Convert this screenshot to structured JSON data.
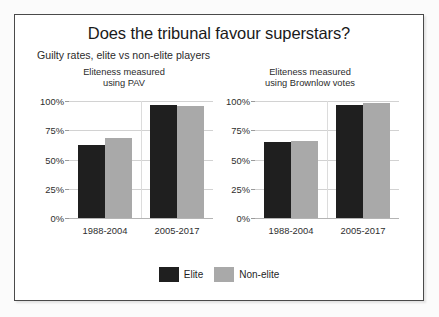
{
  "chart_data": {
    "type": "bar",
    "title": "Does the tribunal favour superstars?",
    "subtitle": "Guilty rates, elite vs non-elite players",
    "xlabel": "",
    "ylabel": "",
    "ylim": [
      0,
      100
    ],
    "grid": true,
    "legend_position": "bottom-center",
    "y_ticks": [
      "0%",
      "25%",
      "50%",
      "75%",
      "100%"
    ],
    "y_tick_values": [
      0,
      25,
      50,
      75,
      100
    ],
    "categories": [
      "1988-2004",
      "2005-2017"
    ],
    "legend": [
      "Elite",
      "Non-elite"
    ],
    "panels": [
      {
        "title_line1": "Eliteness measured",
        "title_line2": "using PAV",
        "series": [
          {
            "name": "Elite",
            "color": "#1f1f1f",
            "values": [
              62,
              97
            ]
          },
          {
            "name": "Non-elite",
            "color": "#a9a9a9",
            "values": [
              68,
              96
            ]
          }
        ]
      },
      {
        "title_line1": "Eliteness measured",
        "title_line2": "using Brownlow votes",
        "series": [
          {
            "name": "Elite",
            "color": "#1f1f1f",
            "values": [
              65,
              97
            ]
          },
          {
            "name": "Non-elite",
            "color": "#a9a9a9",
            "values": [
              66,
              98
            ]
          }
        ]
      }
    ]
  },
  "chart": {
    "title": "Does the tribunal favour superstars?",
    "subtitle": "Guilty rates, elite vs non-elite players"
  },
  "panel_left": {
    "title_line1": "Eliteness measured",
    "title_line2": "using PAV"
  },
  "panel_right": {
    "title_line1": "Eliteness measured",
    "title_line2": "using Brownlow votes"
  },
  "legend": {
    "elite_label": "Elite",
    "nonelite_label": "Non-elite",
    "elite_color": "#1f1f1f",
    "nonelite_color": "#a9a9a9"
  }
}
